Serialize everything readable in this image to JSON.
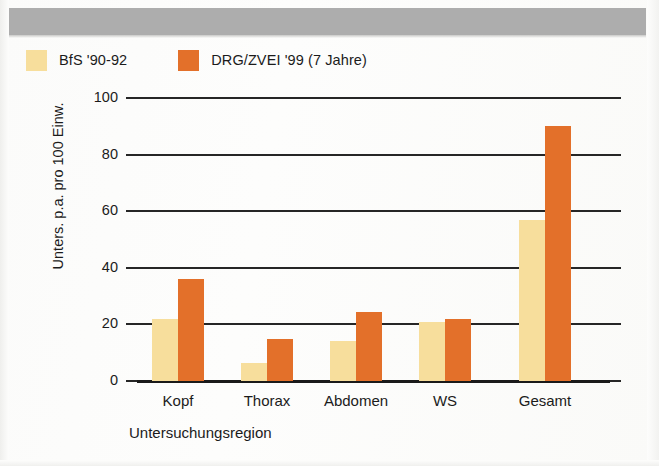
{
  "header": {
    "band_color": "#adadad"
  },
  "legend": {
    "position": "top-left",
    "items": [
      {
        "label": "BfS '90-92",
        "color": "#f7de9c",
        "swatch_name": "legend-swatch-bfs"
      },
      {
        "label": "DRG/ZVEI '99 (7 Jahre)",
        "color": "#e3702a",
        "swatch_name": "legend-swatch-drg"
      }
    ]
  },
  "chart_data": {
    "type": "bar",
    "title": "",
    "subtitle": "",
    "xlabel": "Untersuchungsregion",
    "ylabel": "Unters. p.a. pro 100 Einw.",
    "categories": [
      "Kopf",
      "Thorax",
      "Abdomen",
      "WS",
      "Gesamt"
    ],
    "series": [
      {
        "name": "BfS '90-92",
        "color": "#f7de9c",
        "values": [
          22,
          6.5,
          14,
          21,
          57
        ]
      },
      {
        "name": "DRG/ZVEI '99 (7 Jahre)",
        "color": "#e3702a",
        "values": [
          36,
          15,
          24.5,
          22,
          90
        ]
      }
    ],
    "ylim": [
      0,
      100
    ],
    "yticks": [
      0,
      20,
      40,
      60,
      80,
      100
    ],
    "ytick_labels": [
      "0",
      "20",
      "40",
      "60",
      "80",
      "100"
    ],
    "grid": true,
    "grid_axis": "y",
    "legend_position": "above-plot-left",
    "bar_width_px": 26,
    "axis_color": "#262626"
  }
}
